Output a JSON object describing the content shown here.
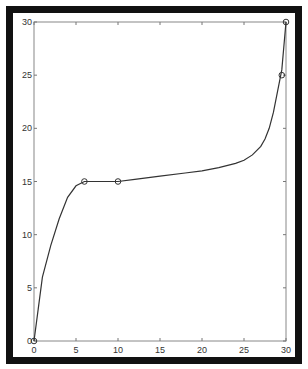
{
  "chart_data": {
    "type": "line",
    "title": "",
    "xlabel": "",
    "ylabel": "",
    "xlim": [
      0,
      30
    ],
    "ylim": [
      0,
      30
    ],
    "grid": false,
    "x_ticks": [
      0,
      5,
      10,
      15,
      20,
      25,
      30
    ],
    "y_ticks": [
      0,
      5,
      10,
      15,
      20,
      25,
      30
    ],
    "x_tick_labels": [
      "0",
      "5",
      "10",
      "15",
      "20",
      "25",
      "30"
    ],
    "y_tick_labels": [
      "0",
      "5",
      "10",
      "15",
      "20",
      "25",
      "30"
    ],
    "series": [
      {
        "name": "curve",
        "style": "line",
        "color": "#333333",
        "x": [
          0,
          0.5,
          1,
          2,
          3,
          4,
          5,
          6,
          8,
          10,
          12,
          15,
          18,
          20,
          22,
          24,
          25,
          26,
          27,
          27.5,
          28,
          28.5,
          29,
          29.5,
          30
        ],
        "y": [
          0,
          3,
          6,
          9,
          11.5,
          13.5,
          14.6,
          15,
          15,
          15,
          15.2,
          15.5,
          15.8,
          16,
          16.3,
          16.7,
          17,
          17.5,
          18.3,
          19,
          20,
          21.5,
          23.5,
          25.5,
          30
        ]
      },
      {
        "name": "data points",
        "style": "marker-circle",
        "color": "#333333",
        "x": [
          0,
          6,
          10,
          29.5,
          30
        ],
        "y": [
          0,
          15,
          15,
          25,
          30
        ]
      }
    ]
  }
}
